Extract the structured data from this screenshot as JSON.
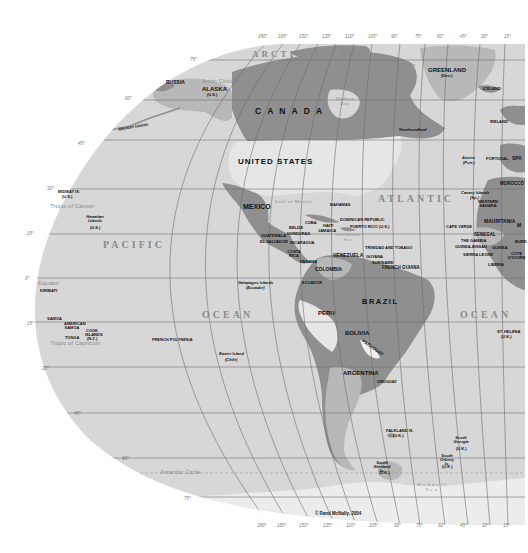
{
  "map": {
    "copyright": "© Rand McNally, 2004",
    "colors": {
      "background": "#ffffff",
      "ocean": "#d7d7d7",
      "land_primary": "#8f8f8f",
      "land_secondary": "#b8b8b8",
      "land_light": "#e6e6e6",
      "grid": "#6e6e6e"
    },
    "oceans": {
      "arctic": "ARCTIC OCEAN",
      "pacific_1": "PACIFIC",
      "pacific_2": "OCEAN",
      "atlantic_1": "ATLANTIC",
      "atlantic_2": "OCEAN"
    },
    "water_bodies": {
      "gulf_of_mexico": "Gulf of Mexico",
      "caribbean": "Caribbean Sea",
      "hudson_bay": "Hudson Bay",
      "baffin_bay": "Baffin Bay",
      "weddell_sea": "Weddell Sea"
    },
    "lines": {
      "arctic_circle": "Arctic Circle",
      "tropic_cancer": "Tropic of Cancer",
      "equator": "Equator",
      "tropic_capricorn": "Tropic of Capricorn",
      "antarctic_circle": "Antarctic Circle"
    },
    "countries": {
      "canada": "C A N A D A",
      "united_states": "UNITED STATES",
      "mexico": "MEXICO",
      "greenland": "GREENLAND",
      "greenland_sub": "(Den.)",
      "russia": "RUSSIA",
      "alaska": "ALASKA",
      "alaska_sub": "(U.S.)",
      "brazil": "BRAZIL",
      "peru": "PERU",
      "bolivia": "BOLIVIA",
      "paraguay": "PARAGUAY",
      "argentina": "ARGENTINA",
      "uruguay": "URUGUAY",
      "colombia": "COLOMBIA",
      "venezuela": "VENEZUELA",
      "ecuador": "ECUADOR",
      "guyana": "GUYANA",
      "suriname": "SURINAME",
      "french_guiana": "FRENCH GUIANA",
      "cuba": "CUBA",
      "haiti": "HAITI",
      "jamaica": "JAMAICA",
      "bahamas": "BAHAMAS",
      "dominican_republic": "DOMINICAN REPUBLIC",
      "puerto_rico": "PUERTO RICO (U.S.)",
      "trinidad": "TRINIDAD AND TOBAGO",
      "belize": "BELIZE",
      "honduras": "HONDURAS",
      "guatemala": "GUATEMALA",
      "el_salvador": "EL SALVADOR",
      "nicaragua": "NICARAGUA",
      "costa_rica": "COSTA RICA",
      "panama": "PANAMA",
      "iceland": "ICELAND",
      "ireland": "IRELAND",
      "portugal": "PORTUGAL",
      "spain": "SPA",
      "morocco": "MOROCCO",
      "western_sahara": "WESTERN SAHARA",
      "mauritania": "MAURITANIA",
      "mali": "M",
      "senegal": "SENEGAL",
      "gambia": "THE GAMBIA",
      "guinea_bissau": "GUINEA-BISSAU",
      "guinea": "GUINEA",
      "sierra_leone": "SIERRA LEONE",
      "liberia": "LIBERIA",
      "cote_divoire": "COTE D'IVOIRE",
      "burkina": "BURK."
    },
    "islands": {
      "aleutian": "Aleutian Islands",
      "newfoundland": "Newfoundland",
      "midway": "MIDWAY IS.",
      "midway_sub": "(U.S.)",
      "hawaiian": "Hawaiian Islands",
      "hawaiian_sub": "(U.S.)",
      "kiribati": "KIRIBATI",
      "samoa": "SAMOA",
      "american_samoa": "AMERICAN SAMOA",
      "tonga": "TONGA",
      "cook_islands": "COOK ISLANDS",
      "cook_sub": "(N.Z.)",
      "french_polynesia": "FRENCH POLYNESIA",
      "galapagos": "Galapagos Islands",
      "galapagos_sub": "(Ecuador)",
      "easter_island": "Easter Island",
      "easter_sub": "(Chile)",
      "azores": "Azores",
      "azores_sub": "(Port.)",
      "canary": "Canary Islands",
      "canary_sub": "(Sp.)",
      "cape_verde": "CAPE VERDE",
      "st_helena": "ST. HELENA",
      "st_helena_sub": "(U.K.)",
      "falkland": "FALKLAND IS.",
      "falkland_sub": "(U.K.)",
      "south_georgia": "South Georgia",
      "south_georgia_sub": "(U.K.)",
      "south_orkney": "South Orkney Is.",
      "south_orkney_sub": "(U.K.)",
      "south_shetland": "South Shetland Is.",
      "south_shetland_sub": "(U.K.)"
    },
    "latitude_ticks": [
      "75°",
      "60°",
      "45°",
      "30°",
      "15°",
      "0°",
      "15°",
      "30°",
      "45°",
      "60°",
      "75°"
    ],
    "longitude_ticks_top": [
      "180°",
      "165°",
      "150°",
      "135°",
      "120°",
      "105°",
      "90°",
      "75°",
      "60°",
      "45°",
      "30°",
      "15°"
    ],
    "longitude_ticks_bottom": [
      "180°",
      "165°",
      "150°",
      "135°",
      "120°",
      "105°",
      "90°",
      "75°",
      "60°",
      "45°",
      "30°",
      "15°"
    ]
  }
}
